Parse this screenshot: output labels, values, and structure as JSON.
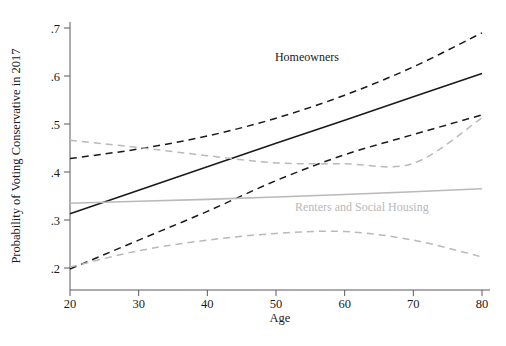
{
  "chart_data": {
    "type": "line",
    "title": "",
    "xlabel": "Age",
    "ylabel": "Probability of Voting Conservative in 2017",
    "xlim": [
      20,
      80
    ],
    "ylim": [
      0.19,
      0.715
    ],
    "xticks": [
      20,
      30,
      40,
      50,
      60,
      70,
      80
    ],
    "xtick_labels": [
      "20",
      "30",
      "40",
      "50",
      "60",
      "70",
      "80"
    ],
    "yticks": [
      0.2,
      0.3,
      0.4,
      0.5,
      0.6,
      0.7
    ],
    "ytick_labels": [
      ".2",
      ".3",
      ".4",
      ".5",
      ".6",
      ".7"
    ],
    "grid": false,
    "legend_position": "inline-annotations",
    "x": [
      20,
      30,
      40,
      50,
      60,
      70,
      80
    ],
    "series": [
      {
        "name": "Homeowners",
        "style": "solid",
        "color": "#1a1a1a",
        "values": [
          0.313,
          0.362,
          0.411,
          0.46,
          0.508,
          0.557,
          0.605
        ]
      },
      {
        "name": "Homeowners upper 95% CI",
        "style": "dashed",
        "color": "#1a1a1a",
        "values": [
          0.428,
          0.448,
          0.475,
          0.512,
          0.56,
          0.619,
          0.69
        ]
      },
      {
        "name": "Homeowners lower 95% CI",
        "style": "dashed",
        "color": "#1a1a1a",
        "values": [
          0.198,
          0.258,
          0.318,
          0.382,
          0.436,
          0.478,
          0.519
        ]
      },
      {
        "name": "Renters and Social Housing",
        "style": "solid",
        "color": "#b9b9b9",
        "values": [
          0.335,
          0.339,
          0.343,
          0.348,
          0.353,
          0.359,
          0.365
        ]
      },
      {
        "name": "Renters upper 95% CI",
        "style": "dashed",
        "color": "#b9b9b9",
        "values": [
          0.466,
          0.451,
          0.434,
          0.419,
          0.417,
          0.418,
          0.513
        ]
      },
      {
        "name": "Renters lower 95% CI",
        "style": "dashed",
        "color": "#b9b9b9",
        "values": [
          0.202,
          0.236,
          0.258,
          0.272,
          0.276,
          0.258,
          0.223
        ]
      }
    ],
    "annotations": [
      {
        "text": "Homeowners",
        "x": 54.5,
        "y": 0.632,
        "color": "#1a1a1a"
      },
      {
        "text": "Renters and Social Housing",
        "x": 62.5,
        "y": 0.318,
        "color": "#b9b9b9"
      }
    ]
  }
}
